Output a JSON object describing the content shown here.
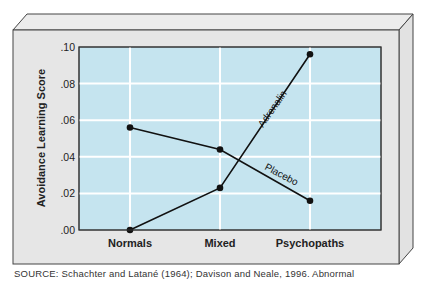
{
  "chart_data": {
    "type": "line",
    "title": "",
    "xlabel": "",
    "ylabel": "Avoidance Learning Score",
    "categories": [
      "Normals",
      "Mixed",
      "Psychopaths"
    ],
    "ylim": [
      0,
      0.1
    ],
    "yticks": [
      ".00",
      ".02",
      ".04",
      ".06",
      ".08",
      ".10"
    ],
    "grid": true,
    "legend": "inline labels on lines",
    "series": [
      {
        "name": "Placebo",
        "values": [
          0.056,
          0.044,
          0.016
        ]
      },
      {
        "name": "Adrenalin",
        "values": [
          0.0,
          0.023,
          0.096
        ]
      }
    ]
  },
  "colors": {
    "plot_background": "#c5e4ef",
    "grid": "#ffffff",
    "frame": "#e4e4e4",
    "line": "#111111"
  },
  "caption": "SOURCE: Schachter and Latané (1964); Davison and Neale, 1996. Abnormal"
}
